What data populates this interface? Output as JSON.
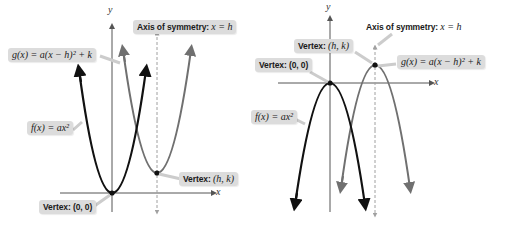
{
  "colors": {
    "f_curve": "#111111",
    "g_curve": "#707070",
    "axis": "#555555",
    "symmetry_line": "#a0a0a0",
    "label_bg": "#dcdcdc"
  },
  "left_panel": {
    "orientation": "opens upward (a > 0)",
    "axis_x_label": "x",
    "axis_y_label": "y",
    "axis_of_symmetry_prefix": "Axis of symmetry:",
    "axis_of_symmetry_eq": "x = h",
    "g_label": "g(x) = a(x − h)² + k",
    "f_label": "f(x) = ax²",
    "vertex_hk_prefix": "Vertex:",
    "vertex_hk_value": "(h, k)",
    "vertex_origin_prefix": "Vertex:",
    "vertex_origin_value": "(0, 0)"
  },
  "right_panel": {
    "orientation": "opens downward (a < 0)",
    "axis_x_label": "x",
    "axis_y_label": "y",
    "axis_of_symmetry_prefix": "Axis of symmetry:",
    "axis_of_symmetry_eq": "x = h",
    "vertex_hk_prefix": "Vertex:",
    "vertex_hk_value": "(h, k)",
    "vertex_origin_prefix": "Vertex:",
    "vertex_origin_value": "(0, 0)",
    "g_label": "g(x) = a(x − h)² + k",
    "f_label": "f(x) = ax²"
  }
}
